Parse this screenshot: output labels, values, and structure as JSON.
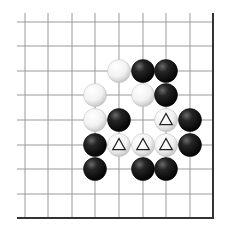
{
  "diagram": {
    "type": "go-board-fragment",
    "grid": {
      "columns_x": [
        25,
        48,
        72,
        95,
        119,
        143,
        166,
        190
      ],
      "rows_y": [
        22,
        46,
        71,
        95,
        120,
        145,
        169,
        194
      ],
      "left_extent": 17,
      "top_extent": 13,
      "right_edge_x": 213,
      "bottom_edge_y": 218,
      "line_color": "#9a9a9a",
      "edge_color": "#333333"
    },
    "stone_radius": 11.5,
    "stones": [
      {
        "color": "white",
        "col": 4,
        "row": 2,
        "mark": ""
      },
      {
        "color": "black",
        "col": 5,
        "row": 2,
        "mark": ""
      },
      {
        "color": "black",
        "col": 6,
        "row": 2,
        "mark": ""
      },
      {
        "color": "white",
        "col": 3,
        "row": 3,
        "mark": ""
      },
      {
        "color": "white",
        "col": 5,
        "row": 3,
        "mark": ""
      },
      {
        "color": "black",
        "col": 6,
        "row": 3,
        "mark": ""
      },
      {
        "color": "white",
        "col": 3,
        "row": 4,
        "mark": ""
      },
      {
        "color": "black",
        "col": 4,
        "row": 4,
        "mark": ""
      },
      {
        "color": "white",
        "col": 6,
        "row": 4,
        "mark": "triangle"
      },
      {
        "color": "black",
        "col": 7,
        "row": 4,
        "mark": ""
      },
      {
        "color": "black",
        "col": 3,
        "row": 5,
        "mark": ""
      },
      {
        "color": "white",
        "col": 4,
        "row": 5,
        "mark": "triangle"
      },
      {
        "color": "white",
        "col": 5,
        "row": 5,
        "mark": "triangle"
      },
      {
        "color": "white",
        "col": 6,
        "row": 5,
        "mark": "triangle"
      },
      {
        "color": "black",
        "col": 7,
        "row": 5,
        "mark": ""
      },
      {
        "color": "black",
        "col": 3,
        "row": 6,
        "mark": ""
      },
      {
        "color": "black",
        "col": 5,
        "row": 6,
        "mark": ""
      },
      {
        "color": "black",
        "col": 6,
        "row": 6,
        "mark": ""
      }
    ]
  }
}
